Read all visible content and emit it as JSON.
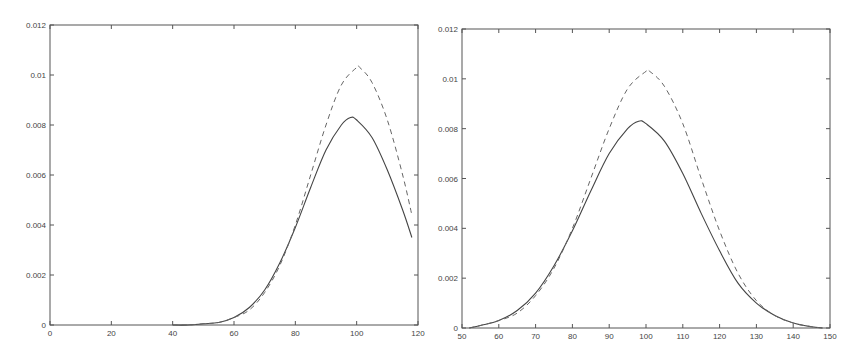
{
  "chart_data": [
    {
      "type": "line",
      "title": "",
      "xlabel": "",
      "ylabel": "",
      "xlim": [
        0,
        120
      ],
      "ylim": [
        0,
        0.012
      ],
      "grid": false,
      "legend": null,
      "x_ticks": [
        0,
        20,
        40,
        60,
        80,
        100,
        120
      ],
      "y_ticks": [
        0,
        0.002,
        0.004,
        0.006,
        0.008,
        0.01,
        0.012
      ],
      "x_tick_labels": [
        "0",
        "20",
        "40",
        "60",
        "80",
        "100",
        "120"
      ],
      "y_tick_labels": [
        "0",
        "0.002",
        "0.004",
        "0.006",
        "0.008",
        "0.01",
        "0.012"
      ],
      "frame": {
        "px_left": 50,
        "px_right": 418,
        "px_top": 25,
        "px_bottom": 325
      },
      "series": [
        {
          "name": "solid",
          "style": "solid",
          "x": [
            40,
            45,
            50,
            55,
            60,
            65,
            70,
            75,
            80,
            85,
            90,
            95,
            98,
            100,
            105,
            110,
            115,
            118
          ],
          "values": [
            0.0,
            0.0,
            5e-05,
            0.0001,
            0.0003,
            0.0007,
            0.0014,
            0.0025,
            0.0039,
            0.0055,
            0.007,
            0.008,
            0.0083,
            0.0082,
            0.0075,
            0.0062,
            0.0046,
            0.0035
          ]
        },
        {
          "name": "dashed",
          "style": "dashed",
          "x": [
            40,
            45,
            50,
            55,
            60,
            65,
            70,
            75,
            80,
            85,
            90,
            95,
            100,
            101,
            105,
            110,
            115,
            118
          ],
          "values": [
            0.0,
            0.0,
            5e-05,
            0.0001,
            0.0003,
            0.0006,
            0.0013,
            0.0024,
            0.004,
            0.006,
            0.008,
            0.0096,
            0.0103,
            0.0103,
            0.0097,
            0.0082,
            0.006,
            0.0044
          ]
        }
      ]
    },
    {
      "type": "line",
      "title": "",
      "xlabel": "",
      "ylabel": "",
      "xlim": [
        50,
        150
      ],
      "ylim": [
        0,
        0.012
      ],
      "grid": false,
      "legend": null,
      "x_ticks": [
        50,
        60,
        70,
        80,
        90,
        100,
        110,
        120,
        130,
        140,
        150
      ],
      "y_ticks": [
        0,
        0.002,
        0.004,
        0.006,
        0.008,
        0.01,
        0.012
      ],
      "x_tick_labels": [
        "50",
        "60",
        "70",
        "80",
        "90",
        "100",
        "110",
        "120",
        "130",
        "140",
        "150"
      ],
      "y_tick_labels": [
        "0",
        "0.002",
        "0.004",
        "0.006",
        "0.008",
        "0.01",
        "0.012"
      ],
      "frame": {
        "px_left": 32,
        "px_right": 400,
        "px_top": 29,
        "px_bottom": 328
      },
      "series": [
        {
          "name": "solid",
          "style": "solid",
          "x": [
            52,
            55,
            60,
            65,
            70,
            75,
            80,
            85,
            90,
            95,
            98,
            100,
            105,
            110,
            115,
            120,
            125,
            130,
            135,
            140,
            145,
            148
          ],
          "values": [
            0.0,
            0.0001,
            0.0003,
            0.0007,
            0.0014,
            0.0025,
            0.0039,
            0.0055,
            0.007,
            0.008,
            0.0083,
            0.0082,
            0.0075,
            0.0062,
            0.0046,
            0.0031,
            0.0018,
            0.001,
            0.0005,
            0.0002,
            5e-05,
            0.0
          ]
        },
        {
          "name": "dashed",
          "style": "dashed",
          "x": [
            52,
            55,
            60,
            65,
            70,
            75,
            80,
            85,
            90,
            95,
            100,
            101,
            105,
            110,
            115,
            120,
            125,
            130,
            135,
            140,
            145,
            148
          ],
          "values": [
            0.0,
            0.0001,
            0.0003,
            0.0006,
            0.0013,
            0.0024,
            0.004,
            0.006,
            0.008,
            0.0096,
            0.0103,
            0.0103,
            0.0097,
            0.0082,
            0.006,
            0.0039,
            0.0022,
            0.0011,
            0.0005,
            0.0002,
            5e-05,
            0.0
          ]
        }
      ]
    }
  ]
}
